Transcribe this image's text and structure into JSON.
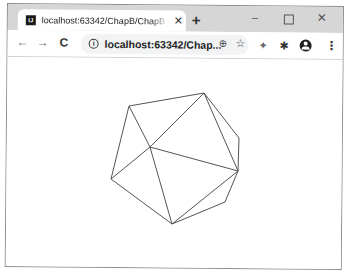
{
  "browser": {
    "tab": {
      "favicon": "JetBrains-icon",
      "favicon_text": "IJ",
      "title": "localhost:63342/ChapB/ChapB",
      "close_glyph": "✕"
    },
    "new_tab_glyph": "+",
    "window_controls": {
      "minimize": "–",
      "maximize": "",
      "close": "✕"
    },
    "toolbar": {
      "back_glyph": "←",
      "forward_glyph": "→",
      "reload_glyph": "C",
      "info_glyph": "i",
      "url": "localhost:63342/Chap...",
      "zoom_glyph": "⊕",
      "star_glyph": "☆",
      "extension1_glyph": "✦",
      "extension2_glyph": "✱",
      "menu_glyph": "⋮"
    }
  },
  "canvas": {
    "stroke_color": "#555555",
    "vertices": {
      "A": [
        129,
        106
      ],
      "B": [
        204,
        93
      ],
      "C": [
        150,
        147
      ],
      "D": [
        111,
        179
      ],
      "E": [
        239,
        138
      ],
      "F": [
        238,
        171
      ],
      "G": [
        225,
        202
      ],
      "H": [
        172,
        224
      ]
    },
    "edges": [
      [
        "A",
        "B"
      ],
      [
        "A",
        "C"
      ],
      [
        "A",
        "D"
      ],
      [
        "B",
        "C"
      ],
      [
        "B",
        "E"
      ],
      [
        "B",
        "F"
      ],
      [
        "C",
        "D"
      ],
      [
        "C",
        "F"
      ],
      [
        "C",
        "H"
      ],
      [
        "D",
        "H"
      ],
      [
        "E",
        "F"
      ],
      [
        "F",
        "G"
      ],
      [
        "F",
        "H"
      ],
      [
        "G",
        "H"
      ]
    ]
  }
}
